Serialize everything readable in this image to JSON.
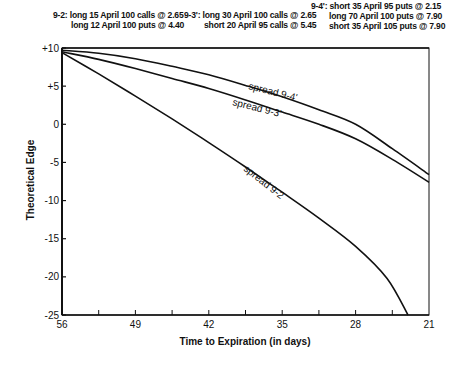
{
  "legend_notes": {
    "spread_9_2": {
      "tag": "9-2:",
      "lines": [
        "long 15 April 100 calls @ 2.65",
        "long 12 April 100 puts @ 4.40"
      ]
    },
    "spread_9_3p": {
      "tag": "9-3':",
      "lines": [
        "long 30 April 100 calls @ 2.65",
        "short 20 April 95 calls @ 5.45"
      ]
    },
    "spread_9_4p": {
      "tag": "9-4':",
      "lines": [
        "short 35 April 95 puts @ 2.15",
        "long 70 April 100 puts @ 7.90",
        "short 35 April 105 puts @ 7.90"
      ]
    }
  },
  "axes": {
    "x_title": "Time to Expiration (in days)",
    "y_title": "Theoretical Edge",
    "x_ticks": [
      "56",
      "49",
      "42",
      "35",
      "28",
      "21"
    ],
    "y_ticks": [
      "+10",
      "+5",
      "0",
      "-5",
      "-10",
      "-15",
      "-20",
      "-25"
    ]
  },
  "curve_labels": {
    "s94": "spread 9-4'",
    "s93": "spread 9-3'",
    "s92": "spread 9-2"
  },
  "chart_data": {
    "type": "line",
    "title": "",
    "xlabel": "Time to Expiration (in days)",
    "ylabel": "Theoretical Edge",
    "xlim": [
      56,
      21
    ],
    "ylim": [
      -25,
      10
    ],
    "x_tick_values": [
      56,
      49,
      42,
      35,
      28,
      21
    ],
    "x_minor_ticks": [
      52.5,
      45.5,
      38.5,
      31.5,
      24.5
    ],
    "y_tick_values": [
      10,
      5,
      0,
      -5,
      -10,
      -15,
      -20,
      -25
    ],
    "grid": false,
    "legend_position": "top (spread compositions listed above plot)",
    "annotations": [
      "9-2: long 15 April 100 calls @ 2.65 / long 12 April 100 puts @ 4.40",
      "9-3': long 30 April 100 calls @ 2.65 / short 20 April 95 calls @ 5.45",
      "9-4': short 35 April 95 puts @ 2.15 / long 70 April 100 puts @ 7.90 / short 35 April 105 puts @ 7.90"
    ],
    "series": [
      {
        "name": "spread 9-4'",
        "x": [
          56,
          52.5,
          49,
          45.5,
          42,
          38.5,
          35,
          31.5,
          28,
          24.5,
          21
        ],
        "y": [
          9.7,
          9.3,
          8.6,
          7.6,
          6.5,
          5.1,
          3.6,
          1.9,
          0.0,
          -3.2,
          -6.6
        ]
      },
      {
        "name": "spread 9-3'",
        "x": [
          56,
          52.5,
          49,
          45.5,
          42,
          38.5,
          35,
          31.5,
          28,
          24.5,
          21
        ],
        "y": [
          9.5,
          8.5,
          7.3,
          6.0,
          4.7,
          3.2,
          1.6,
          0.0,
          -1.9,
          -4.6,
          -7.6
        ]
      },
      {
        "name": "spread 9-2",
        "x": [
          56,
          52.5,
          49,
          45.5,
          42,
          38.5,
          35,
          31.5,
          28,
          25,
          23
        ],
        "y": [
          9.4,
          6.6,
          3.7,
          0.7,
          -2.4,
          -5.6,
          -8.9,
          -12.3,
          -16.0,
          -20.2,
          -25.0
        ]
      }
    ]
  }
}
